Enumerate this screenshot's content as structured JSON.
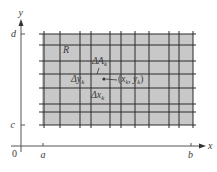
{
  "figure": {
    "type": "double-integral-partition-diagram",
    "colors": {
      "region_fill": "#c8c8c8",
      "grid_line": "#2a2a2a",
      "axis": "#555555",
      "text": "#3a3a3a"
    },
    "axes": {
      "x_label": "x",
      "y_label": "y",
      "origin_label": "0",
      "x_ticks": [
        {
          "label": "a",
          "x": 43
        },
        {
          "label": "b",
          "x": 191
        }
      ],
      "y_ticks": [
        {
          "label": "c",
          "y": 125
        },
        {
          "label": "d",
          "y": 34
        }
      ]
    },
    "region": {
      "label": "R",
      "left": 42,
      "right": 193,
      "top": 34,
      "bottom": 125
    },
    "grid": {
      "vertical_x": [
        44,
        60,
        80,
        91,
        110,
        121,
        135,
        149,
        169,
        179,
        193
      ],
      "horizontal_y": [
        34,
        45,
        61,
        74,
        88,
        104,
        112,
        125
      ]
    },
    "annotations": {
      "area_element": {
        "base": "ΔA",
        "sub": "k"
      },
      "dy": {
        "base": "Δy",
        "sub": "k"
      },
      "dx": {
        "base": "Δx",
        "sub": "k"
      },
      "sample_point": {
        "open": "(",
        "x_base": "x",
        "x_sub": "k",
        "sep": ", ",
        "y_base": "y",
        "y_sub": "k",
        "close": ")"
      }
    }
  }
}
